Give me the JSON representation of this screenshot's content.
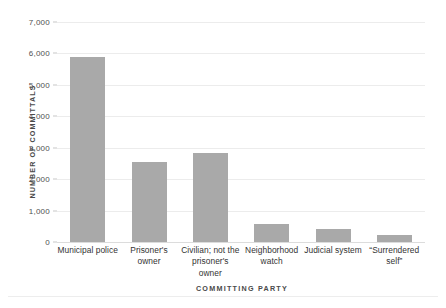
{
  "chart_data": {
    "type": "bar",
    "title": "",
    "xlabel": "COMMITTING PARTY",
    "ylabel": "NUMBER OF COMMITTALS",
    "categories": [
      "Municipal police",
      "Prisoner's owner",
      "Civilian; not the prisoner's owner",
      "Neighborhood watch",
      "Judicial system",
      "“Surrendered self”"
    ],
    "values": [
      5900,
      2550,
      2830,
      560,
      410,
      220
    ],
    "ylim": [
      0,
      7000
    ],
    "ytick_values": [
      0,
      1000,
      2000,
      3000,
      4000,
      5000,
      6000,
      7000
    ],
    "ytick_labels": [
      "0",
      "1,000",
      "2,000",
      "3,000",
      "4,000",
      "5,000",
      "6,000",
      "7,000"
    ],
    "grid": true,
    "legend": null,
    "bar_color": "#a9a9a9",
    "gridline_color": "#ececec",
    "background_color": "#ffffff"
  }
}
